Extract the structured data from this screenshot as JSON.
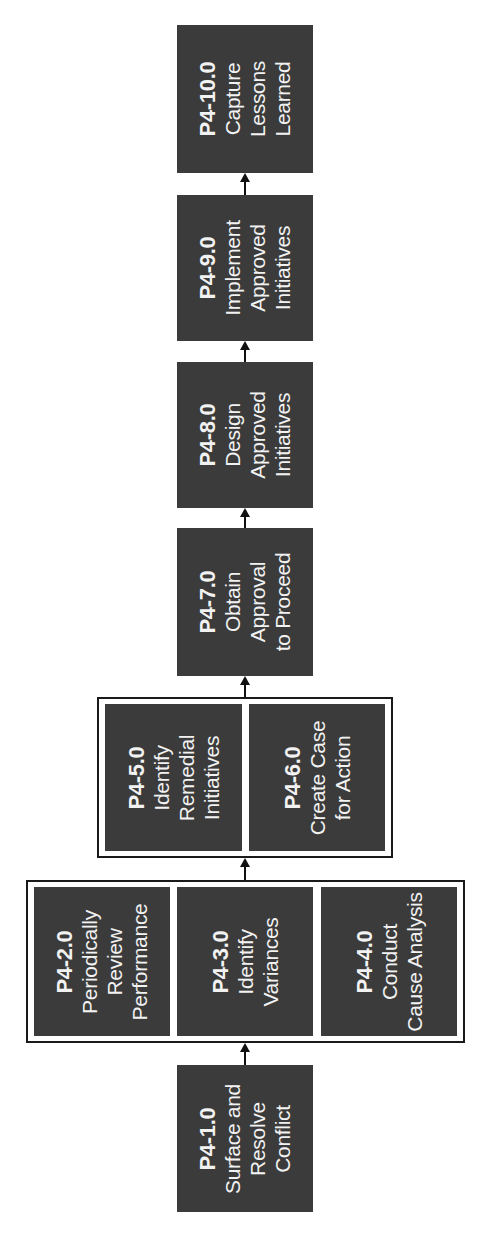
{
  "diagram": {
    "orientation": "rotated -90deg (flow bottom to top)",
    "colors": {
      "box_fill": "#3b3b3b",
      "box_text": "#f2f2f2",
      "group_border": "#1a1a1a",
      "connector": "#111111",
      "background": "#ffffff"
    },
    "steps": {
      "p1": {
        "code": "P4-1.0",
        "lines": [
          "Surface and",
          "Resolve",
          "Conflict"
        ]
      },
      "p2": {
        "code": "P4-2.0",
        "lines": [
          "Periodically",
          "Review",
          "Performance"
        ]
      },
      "p3": {
        "code": "P4-3.0",
        "lines": [
          "Identify",
          "Variances"
        ]
      },
      "p4": {
        "code": "P4-4.0",
        "lines": [
          "Conduct",
          "Cause Analysis"
        ]
      },
      "p5": {
        "code": "P4-5.0",
        "lines": [
          "Identify",
          "Remedial",
          "Initiatives"
        ]
      },
      "p6": {
        "code": "P4-6.0",
        "lines": [
          "Create Case",
          "for Action"
        ]
      },
      "p7": {
        "code": "P4-7.0",
        "lines": [
          "Obtain",
          "Approval",
          "to Proceed"
        ]
      },
      "p8": {
        "code": "P4-8.0",
        "lines": [
          "Design",
          "Approved",
          "Initiatives"
        ]
      },
      "p9": {
        "code": "P4-9.0",
        "lines": [
          "Implement",
          "Approved",
          "Initiatives"
        ]
      },
      "p10": {
        "code": "P4-10.0",
        "lines": [
          "Capture",
          "Lessons",
          "Learned"
        ]
      }
    },
    "groups": [
      {
        "name": "group-review-analysis",
        "members": [
          "P4-2.0",
          "P4-3.0",
          "P4-4.0"
        ]
      },
      {
        "name": "group-remedial-case",
        "members": [
          "P4-5.0",
          "P4-6.0"
        ]
      }
    ],
    "flow": [
      "P4-1.0",
      "group-review-analysis",
      "group-remedial-case",
      "P4-7.0",
      "P4-8.0",
      "P4-9.0",
      "P4-10.0"
    ]
  }
}
